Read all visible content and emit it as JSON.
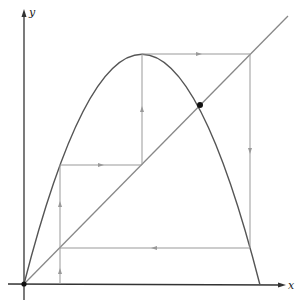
{
  "diagram": {
    "type": "cobweb-plot",
    "axes": {
      "x_label": "x",
      "y_label": "y"
    },
    "curve": {
      "name": "parabola f(x)",
      "start": [
        24,
        284
      ],
      "peak": [
        142,
        54
      ],
      "end": [
        260,
        285
      ]
    },
    "diagonal": {
      "name": "y = x",
      "start": [
        24,
        284
      ],
      "end": [
        288,
        16
      ]
    },
    "fixed_point": [
      200,
      105
    ],
    "origin_point": [
      24,
      284
    ],
    "cobweb_path": [
      [
        60,
        284
      ],
      [
        60,
        248
      ],
      [
        60,
        165
      ],
      [
        142,
        165
      ],
      [
        142,
        54
      ],
      [
        250,
        54
      ],
      [
        250,
        248
      ],
      [
        60,
        248
      ]
    ],
    "arrows": [
      {
        "at": [
          60,
          272
        ],
        "dir": "up"
      },
      {
        "at": [
          60,
          205
        ],
        "dir": "up"
      },
      {
        "at": [
          100,
          165
        ],
        "dir": "right"
      },
      {
        "at": [
          142,
          110
        ],
        "dir": "up"
      },
      {
        "at": [
          198,
          54
        ],
        "dir": "right"
      },
      {
        "at": [
          250,
          150
        ],
        "dir": "down"
      },
      {
        "at": [
          155,
          248
        ],
        "dir": "left"
      }
    ]
  }
}
